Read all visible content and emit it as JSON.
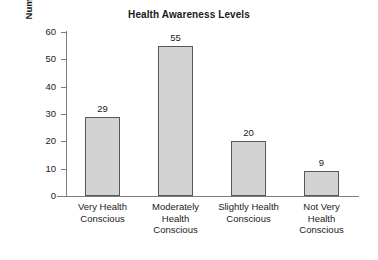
{
  "chart_data": {
    "type": "bar",
    "title": "Health Awareness Levels",
    "xlabel": "",
    "ylabel": "Number of Students",
    "categories": [
      "Very Health Conscious",
      "Moderately Health Conscious",
      "Slightly Health Conscious",
      "Not Very Health Conscious"
    ],
    "category_lines": [
      [
        "Very Health",
        "Conscious"
      ],
      [
        "Moderately",
        "Health",
        "Conscious"
      ],
      [
        "Slightly Health",
        "Conscious"
      ],
      [
        "Not Very",
        "Health",
        "Conscious"
      ]
    ],
    "values": [
      29,
      55,
      20,
      9
    ],
    "value_labels": [
      "29",
      "55",
      "20",
      "9"
    ],
    "ylim": [
      0,
      60
    ],
    "yticks": [
      0,
      10,
      20,
      30,
      40,
      50,
      60
    ],
    "ytick_labels": [
      "0",
      "10",
      "20",
      "30",
      "40",
      "50",
      "60"
    ],
    "grid": false,
    "legend": false,
    "colors": {
      "bar_fill": "#d3d3d3",
      "bar_border": "#585858",
      "axis": "#7d7d7d",
      "text": "#1a1a1a",
      "background": "#ffffff"
    }
  }
}
